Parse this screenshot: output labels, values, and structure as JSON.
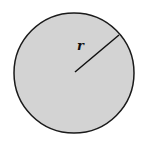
{
  "diagram": {
    "shape": "circle",
    "fill_color": "#d3d3d3",
    "stroke_color": "#1a1a1a",
    "radius_label": "r",
    "radius_direction": "upper-right"
  }
}
